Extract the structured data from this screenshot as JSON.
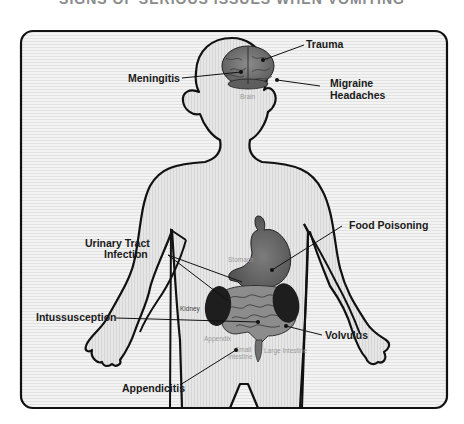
{
  "title": "SIGNS OF SERIOUS ISSUES WHEN VOMITING",
  "colors": {
    "outline": "#111111",
    "body_fill": "#e4e4e4",
    "panel_fill": "#ececec",
    "brain": "#7a7a7a",
    "stomach": "#6e6e6e",
    "kidney": "#1e1e1e",
    "intestine": "#8a8a8a",
    "label_text": "#1a1a1a",
    "organ_label_text": "#9a9a9a"
  },
  "organs": {
    "brain": "Brain",
    "stomach": "Stomach",
    "kidney": "Kidney",
    "appendix": "Appendix",
    "small_intestine_line1": "Small",
    "small_intestine_line2": "Intestine",
    "large_intestine": "Large Intestine"
  },
  "conditions": {
    "trauma": "Trauma",
    "meningitis": "Meningitis",
    "migraine_line1": "Migraine",
    "migraine_line2": "Headaches",
    "food_poisoning": "Food Poisoning",
    "uti_line1": "Urinary Tract",
    "uti_line2": "Infection",
    "intussusception": "Intussusception",
    "volvulus": "Volvulus",
    "appendicitis": "Appendicitis"
  }
}
